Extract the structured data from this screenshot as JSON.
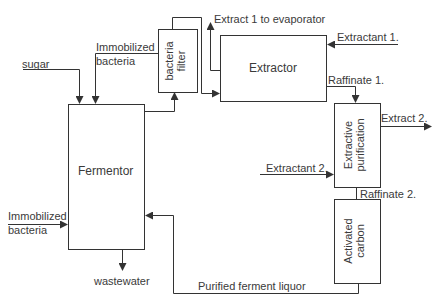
{
  "diagram": {
    "type": "process flow diagram",
    "units": {
      "fermentor": "Fermentor",
      "bacteria_filter": [
        "bacteria",
        "filter"
      ],
      "extractor": "Extractor",
      "extractive_purification": [
        "Extractive",
        "purification"
      ],
      "activated_carbon": [
        "Activated",
        "carbon"
      ]
    },
    "streams": {
      "sugar": "sugar",
      "immobilized_bacteria_top": [
        "Immobilized",
        "bacteria"
      ],
      "immobilized_bacteria_left": [
        "Immobilized",
        "bacteria"
      ],
      "wastewater": "wastewater",
      "extract1": "Extract 1 to evaporator",
      "extractant1": "Extractant 1.",
      "raffinate1": "Raffinate 1.",
      "extract2": "Extract 2.",
      "extractant2": "Extractant 2.",
      "raffinate2": "Raffinate 2.",
      "purified_liquor": "Purified ferment liquor"
    },
    "colors": {
      "line": "#333333",
      "background": "#ffffff"
    }
  }
}
